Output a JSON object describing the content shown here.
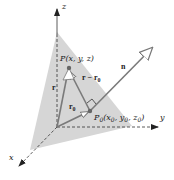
{
  "diagram": {
    "axes": {
      "x_label": "x",
      "y_label": "y",
      "z_label": "z"
    },
    "points": {
      "P": {
        "name": "P",
        "coords": "(x, y, z)"
      },
      "P0": {
        "name": "P",
        "sub": "0",
        "coords_open": "(x",
        "x_sub": "0",
        "y_part": ", y",
        "y_sub": "0",
        "z_part": ", z",
        "z_sub": "0",
        "close": ")"
      }
    },
    "vectors": {
      "r": "r",
      "r0_main": "r",
      "r0_sub": "0",
      "diff_main": "r − r",
      "diff_sub": "0",
      "n": "n"
    },
    "colors": {
      "plane": "#d6d6d6",
      "vector": "#7a7a7a",
      "axis": "#333333",
      "point": "#666666"
    }
  }
}
